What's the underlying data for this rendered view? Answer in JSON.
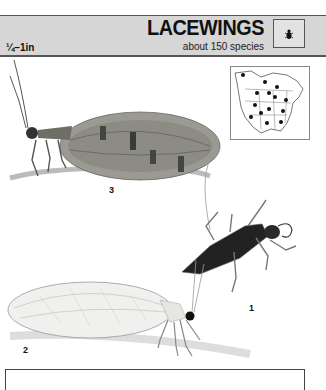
{
  "header": {
    "size_range": "¼–1in",
    "title": "LACEWINGS",
    "subtitle": "about 150 species",
    "icon": "insect-silhouette-icon"
  },
  "range_map": {
    "region": "North America",
    "marker_count": 14
  },
  "illustrations": [
    {
      "number": "3",
      "description": "brown lacewing adult, side view with patterned wings"
    },
    {
      "number": "1",
      "description": "lacewing larva, dark segmented body with curved jaws"
    },
    {
      "number": "2",
      "description": "green lacewing adult, translucent veined wings"
    }
  ],
  "colors": {
    "header_bg": "#d6d6d6",
    "text": "#111111",
    "border": "#555555"
  }
}
